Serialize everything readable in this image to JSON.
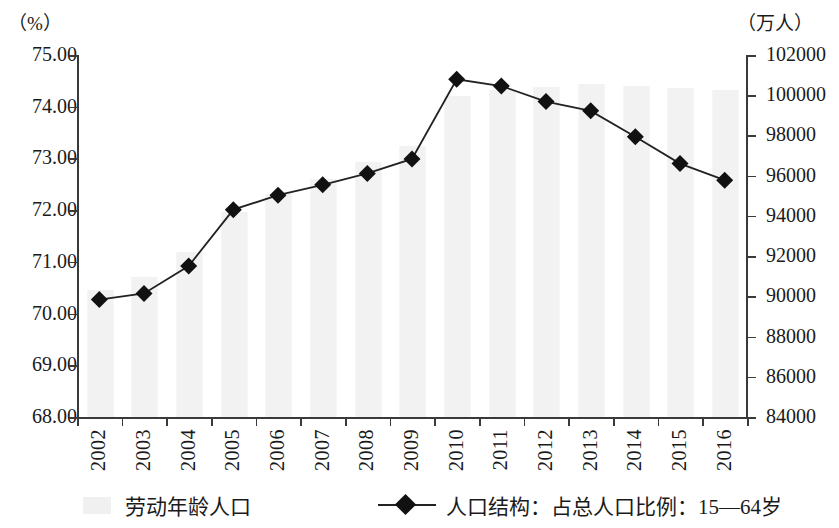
{
  "axes": {
    "left_unit": "（%）",
    "right_unit": "（万人）",
    "left_ticks": [
      "75.00",
      "74.00",
      "73.00",
      "72.00",
      "71.00",
      "70.00",
      "69.00",
      "68.00"
    ],
    "right_ticks": [
      "102000",
      "100000",
      "98000",
      "96000",
      "94000",
      "92000",
      "90000",
      "88000",
      "86000",
      "84000"
    ],
    "left_min": 68.0,
    "left_max": 75.0,
    "right_min": 84000,
    "right_max": 102000
  },
  "legend": {
    "bars_label": "劳动年龄人口",
    "line_label": "人口结构：占总人口比例：15—64岁"
  },
  "chart_data": {
    "type": "bar",
    "title": "",
    "subtitle": "",
    "xlabel": "",
    "ylabel": "（%）",
    "y2label": "（万人）",
    "ylim": [
      68.0,
      75.0
    ],
    "y2lim": [
      84000,
      102000
    ],
    "grid": false,
    "legend_position": "bottom",
    "categories": [
      "2002",
      "2003",
      "2004",
      "2005",
      "2006",
      "2007",
      "2008",
      "2009",
      "2010",
      "2011",
      "2012",
      "2013",
      "2014",
      "2015",
      "2016"
    ],
    "series": [
      {
        "name": "劳动年龄人口",
        "type": "bar",
        "axis": "right",
        "unit": "万人",
        "values": [
          90302,
          90976,
          92184,
          94197,
          95068,
          95833,
          96680,
          97484,
          99938,
          100283,
          100403,
          100582,
          100469,
          100361,
          100260
        ]
      },
      {
        "name": "人口结构：占总人口比例：15—64岁",
        "type": "line",
        "axis": "left",
        "unit": "%",
        "marker": "diamond",
        "values": [
          70.27,
          70.39,
          70.92,
          72.01,
          72.29,
          72.49,
          72.71,
          72.99,
          74.53,
          74.4,
          74.1,
          73.92,
          73.42,
          72.9,
          72.58
        ]
      }
    ]
  }
}
